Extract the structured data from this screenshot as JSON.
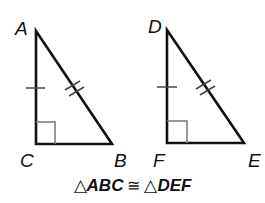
{
  "diagram": {
    "stroke_color": "#111111",
    "right_angle_color": "#666666",
    "triangles": [
      {
        "name": "ABC",
        "vertices": {
          "A": {
            "label": "A",
            "x": 36,
            "y": 31
          },
          "C": {
            "label": "C",
            "x": 36,
            "y": 144
          },
          "B": {
            "label": "B",
            "x": 112,
            "y": 144
          }
        },
        "right_angle_at": "C",
        "single_tick_side": "AC",
        "double_tick_side": "AB"
      },
      {
        "name": "DEF",
        "vertices": {
          "D": {
            "label": "D",
            "x": 167,
            "y": 30
          },
          "F": {
            "label": "F",
            "x": 167,
            "y": 143
          },
          "E": {
            "label": "E",
            "x": 244,
            "y": 143
          }
        },
        "right_angle_at": "F",
        "single_tick_side": "DF",
        "double_tick_side": "DE"
      }
    ],
    "labels": {
      "A": "A",
      "B": "B",
      "C": "C",
      "D": "D",
      "E": "E",
      "F": "F"
    },
    "caption": {
      "triangle_symbol": "△",
      "first": "ABC",
      "congruent_symbol": "≅",
      "second": "DEF"
    }
  }
}
